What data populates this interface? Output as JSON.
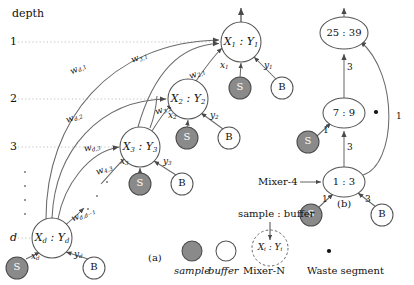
{
  "figure": {
    "panel_a_label": "(a)",
    "panel_b_label": "(b)",
    "depth_axis_title": "depth",
    "depth_ticks": [
      "1",
      "2",
      "3",
      "d"
    ],
    "depth_ellipsis": "·"
  },
  "panel_a": {
    "mixer_nodes": [
      {
        "id": "n1",
        "label": "X₁ : Y₁",
        "x": 241,
        "y": 42,
        "rx": 20,
        "ry": 20
      },
      {
        "id": "n2",
        "label": "X₂ : Y₂",
        "x": 188,
        "y": 99,
        "rx": 20,
        "ry": 20
      },
      {
        "id": "n3",
        "label": "X₃ : Y₃",
        "x": 140,
        "y": 147,
        "rx": 20,
        "ry": 20
      },
      {
        "id": "nd",
        "label": "Xd : Yd",
        "x": 52,
        "y": 238,
        "rx": 20,
        "ry": 20
      }
    ],
    "sample_nodes": [
      {
        "label": "S",
        "x": 240,
        "y": 88
      },
      {
        "label": "S",
        "x": 187,
        "y": 138
      },
      {
        "label": "S",
        "x": 140,
        "y": 184
      },
      {
        "label": "S",
        "x": 17,
        "y": 268
      }
    ],
    "buffer_nodes": [
      {
        "label": "B",
        "x": 282,
        "y": 88
      },
      {
        "label": "B",
        "x": 229,
        "y": 138
      },
      {
        "label": "B",
        "x": 182,
        "y": 184
      },
      {
        "label": "B",
        "x": 94,
        "y": 268
      }
    ],
    "reagent_edge_labels": [
      {
        "text": "x",
        "sub": "1",
        "x": 222,
        "y": 66
      },
      {
        "text": "y",
        "sub": "1",
        "x": 266,
        "y": 66
      },
      {
        "text": "x",
        "sub": "2",
        "x": 170,
        "y": 116
      },
      {
        "text": "y",
        "sub": "2",
        "x": 212,
        "y": 116
      },
      {
        "text": "x",
        "sub": "3",
        "x": 122,
        "y": 162
      },
      {
        "text": "y",
        "sub": "3",
        "x": 165,
        "y": 162
      },
      {
        "text": "x",
        "sub": "d",
        "x": 33,
        "y": 257
      },
      {
        "text": "y",
        "sub": "d",
        "x": 76,
        "y": 255
      }
    ],
    "weight_labels": [
      {
        "text": "w",
        "sub": "d,1",
        "x": 74,
        "y": 69
      },
      {
        "text": "w",
        "sub": "3,1",
        "x": 135,
        "y": 58
      },
      {
        "text": "w",
        "sub": "2,1",
        "x": 193,
        "y": 74
      },
      {
        "text": "w",
        "sub": "d,2",
        "x": 70,
        "y": 118
      },
      {
        "text": "w",
        "sub": "3,2",
        "x": 159,
        "y": 110
      },
      {
        "text": "w",
        "sub": "d,3",
        "x": 88,
        "y": 148
      },
      {
        "text": "w",
        "sub": "4,3",
        "x": 100,
        "y": 170
      },
      {
        "text": "w",
        "sub": "d,d−1",
        "x": 75,
        "y": 215
      }
    ]
  },
  "panel_b": {
    "mixer_nodes": [
      {
        "id": "b_top",
        "label": "25 : 39",
        "x": 344,
        "y": 33,
        "rx": 24,
        "ry": 16
      },
      {
        "id": "b_mid",
        "label": "7 : 9",
        "x": 344,
        "y": 113,
        "rx": 21,
        "ry": 15
      },
      {
        "id": "b_bot",
        "label": "1 : 3",
        "x": 344,
        "y": 182,
        "rx": 21,
        "ry": 15
      }
    ],
    "sample_nodes": [
      {
        "label": "S",
        "x": 308,
        "y": 142
      },
      {
        "label": "S",
        "x": 311,
        "y": 215
      }
    ],
    "buffer_nodes": [
      {
        "label": "B",
        "x": 382,
        "y": 215
      }
    ],
    "edge_weights": [
      {
        "value": "3",
        "x": 349,
        "y": 68
      },
      {
        "value": "1",
        "x": 326,
        "y": 131
      },
      {
        "value": "3",
        "x": 349,
        "y": 148
      },
      {
        "value": "1",
        "x": 325,
        "y": 200
      },
      {
        "value": "3",
        "x": 368,
        "y": 200
      },
      {
        "value": "1",
        "x": 398,
        "y": 117
      }
    ],
    "mixer_callout": "Mixer-4",
    "waste_dot": {
      "x": 376,
      "y": 112
    }
  },
  "legend": {
    "sample_label": "sample",
    "buffer_label": "buffer",
    "sample_glyph": "S",
    "buffer_glyph": "B",
    "mixer_label": "Mixer-N",
    "mixer_glyph": "Xᵢ : Yᵢ",
    "mixer_callout": "sample : buffer",
    "waste_label": "Waste segment"
  },
  "colors": {
    "sample_fill": "#8a8a8a",
    "sample_stroke": "#4a4a4a",
    "buffer_fill": "#ffffff",
    "node_stroke": "#555555",
    "edge_stroke": "#6b6b6b",
    "text": "#111111",
    "guide_dotted": "#aaaaaa"
  }
}
